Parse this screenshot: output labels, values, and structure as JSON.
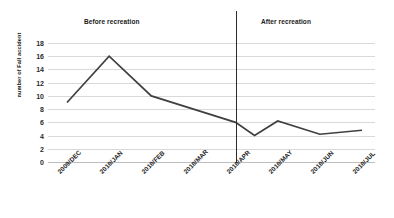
{
  "chart_data": {
    "type": "line",
    "title": "",
    "xlabel": "",
    "ylabel": "number of Fall accident",
    "ylim": [
      0,
      18
    ],
    "ytick_values": [
      18,
      16,
      14,
      12,
      10,
      8,
      6,
      4,
      2,
      0
    ],
    "grid": "horizontal",
    "legend": "none",
    "categories": [
      "2009/DEC",
      "2010/JAN",
      "2010/FEB",
      "2010/MAR",
      "2010/APR",
      "2010/MAY",
      "2010/JUN",
      "2010/JUL"
    ],
    "values": [
      9,
      16,
      10,
      8,
      6,
      6.2,
      4.2,
      4.8
    ],
    "extra_points": [
      {
        "label": "dip after recreation",
        "x": 4.45,
        "y": 4
      }
    ],
    "series": [
      {
        "name": "number of Fall accident",
        "color": "#3f3f3f",
        "values": [
          9,
          16,
          10,
          8,
          6,
          6.2,
          4.2,
          4.8
        ]
      }
    ],
    "annotations": [
      {
        "name": "before",
        "text": "Before recreation"
      },
      {
        "name": "after",
        "text": "After recreation"
      },
      {
        "name": "divider",
        "text": ""
      }
    ],
    "colors": {
      "line": "#3f3f3f",
      "grid": "#d9d9d9",
      "divider": "#2b2b2b",
      "text": "#1a1a1a",
      "background": "#ffffff"
    }
  }
}
